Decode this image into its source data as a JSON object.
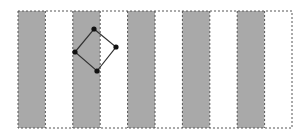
{
  "diagram": {
    "width": 308,
    "height": 137,
    "frame": {
      "x": 18,
      "y": 11,
      "width": 274,
      "height": 117,
      "stroke": "#555555"
    },
    "stripes": {
      "count": 10,
      "shaded_indices": [
        0,
        2,
        4,
        6,
        8
      ],
      "shaded_color": "#a9a9a9",
      "unshaded_color": "#ffffff",
      "divider_color": "#555555"
    },
    "polygon": {
      "shape": "diamond",
      "stroke": "#333333",
      "vertex_color": "#111111",
      "vertices": [
        {
          "name": "top",
          "x": 94,
          "y": 29
        },
        {
          "name": "right",
          "x": 116,
          "y": 47
        },
        {
          "name": "bottom",
          "x": 97,
          "y": 71
        },
        {
          "name": "left",
          "x": 75,
          "y": 52
        }
      ]
    }
  }
}
